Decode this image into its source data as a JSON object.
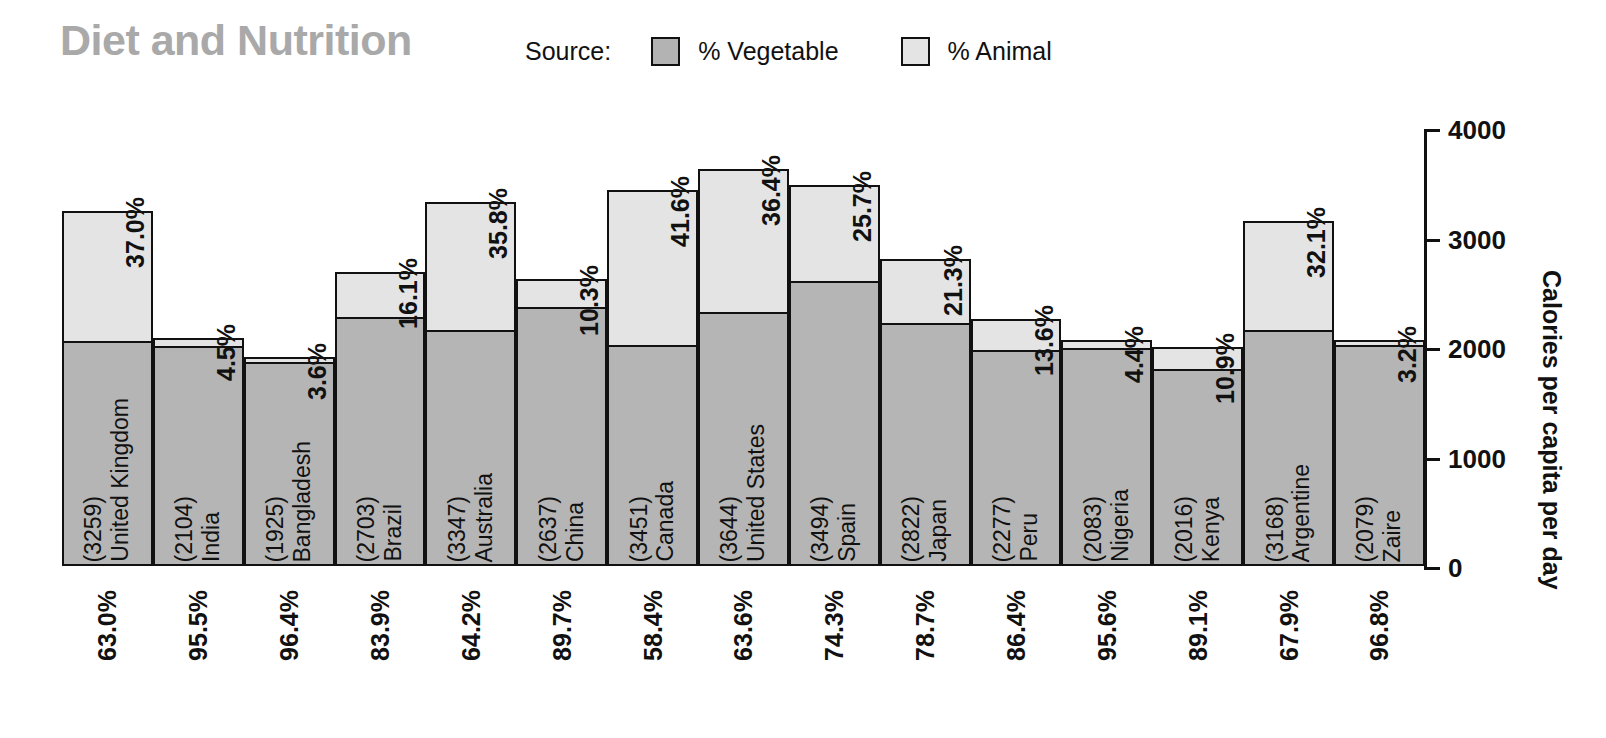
{
  "header": {
    "title": "Diet and Nutrition",
    "legend": {
      "source_label": "Source:",
      "items": [
        {
          "label": "% Vegetable",
          "swatch": "vegetable-swatch",
          "color": "#b3b3b3"
        },
        {
          "label": "% Animal",
          "swatch": "animal-swatch",
          "color": "#e4e4e4"
        }
      ]
    }
  },
  "axis": {
    "ylabel": "Calories per capita per day",
    "ticks": [
      "0",
      "1000",
      "2000",
      "3000",
      "4000"
    ]
  },
  "chart_data": {
    "type": "bar",
    "title": "Diet and Nutrition",
    "xlabel": "",
    "ylabel": "Calories per capita per day",
    "ylim": [
      0,
      4000
    ],
    "yticks": [
      0,
      1000,
      2000,
      3000,
      4000
    ],
    "grid": false,
    "stacked": true,
    "legend_position": "top",
    "categories": [
      "United Kingdom",
      "India",
      "Bangladesh",
      "Brazil",
      "Australia",
      "China",
      "Canada",
      "United States",
      "Spain",
      "Japan",
      "Peru",
      "Nigeria",
      "Kenya",
      "Argentine",
      "Zaire"
    ],
    "category_labels": [
      [
        "United Kingdom",
        "(3259)"
      ],
      [
        "India",
        "(2104)"
      ],
      [
        "Bangladesh",
        "(1925)"
      ],
      [
        "Brazil",
        "(2703)"
      ],
      [
        "Australia",
        "(3347)"
      ],
      [
        "China",
        "(2637)"
      ],
      [
        "Canada",
        "(3451)"
      ],
      [
        "United States",
        "(3644)"
      ],
      [
        "Spain",
        "(3494)"
      ],
      [
        "Japan",
        "(2822)"
      ],
      [
        "Peru",
        "(2277)"
      ],
      [
        "Nigeria",
        "(2083)"
      ],
      [
        "Kenya",
        "(2016)"
      ],
      [
        "Argentine",
        "(3168)"
      ],
      [
        "Zaire",
        "(2079)"
      ]
    ],
    "totals": [
      3259,
      2104,
      1925,
      2703,
      3347,
      2637,
      3451,
      3644,
      3494,
      2822,
      2277,
      2083,
      2016,
      3168,
      2079
    ],
    "series": [
      {
        "name": "% Vegetable",
        "color": "#b5b5b5",
        "pct_labels": [
          "63.0%",
          "95.5%",
          "96.4%",
          "83.9%",
          "64.2%",
          "89.7%",
          "58.4%",
          "63.6%",
          "74.3%",
          "78.7%",
          "86.4%",
          "95.6%",
          "89.1%",
          "67.9%",
          "96.8%"
        ],
        "pct_values": [
          63.0,
          95.5,
          96.4,
          83.9,
          64.2,
          89.7,
          58.4,
          63.6,
          74.3,
          78.7,
          86.4,
          95.6,
          89.1,
          67.9,
          96.8
        ],
        "values": [
          2053,
          2009,
          1856,
          2268,
          2149,
          2366,
          2015,
          2318,
          2596,
          2221,
          1967,
          1991,
          1796,
          2151,
          2013
        ]
      },
      {
        "name": "% Animal",
        "color": "#e4e4e4",
        "pct_labels": [
          "37.0%",
          "4.5%",
          "3.6%",
          "16.1%",
          "35.8%",
          "10.3%",
          "41.6%",
          "36.4%",
          "25.7%",
          "21.3%",
          "13.6%",
          "4.4%",
          "10.9%",
          "32.1%",
          "3.2%"
        ],
        "pct_values": [
          37.0,
          4.5,
          3.6,
          16.1,
          35.8,
          10.3,
          41.6,
          36.4,
          25.7,
          21.3,
          13.6,
          4.4,
          10.9,
          32.1,
          3.2
        ],
        "values": [
          1206,
          95,
          69,
          435,
          1198,
          272,
          1436,
          1326,
          898,
          601,
          310,
          92,
          220,
          1017,
          67
        ]
      }
    ]
  }
}
